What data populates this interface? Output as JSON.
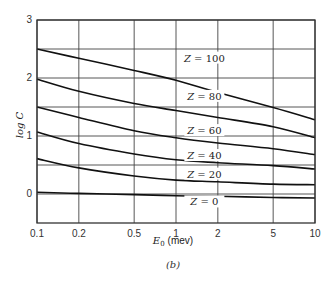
{
  "chart_data": {
    "type": "line",
    "title": "",
    "caption": "(b)",
    "xlabel": "E0 (mev)",
    "xlabel_main": "E",
    "xlabel_sub": "0",
    "xlabel_unit": "(mev)",
    "ylabel": "log C",
    "xscale": "log",
    "xlim": [
      0.1,
      10
    ],
    "ylim": [
      -0.5,
      3
    ],
    "grid": true,
    "legend_position": "inline labels",
    "x_ticks": [
      0.1,
      0.2,
      0.5,
      1,
      2,
      5,
      10
    ],
    "x_tick_labels": [
      "0.1",
      "0.2",
      "0.5",
      "1",
      "2",
      "5",
      "10"
    ],
    "y_ticks": [
      0,
      1,
      2,
      3
    ],
    "y_tick_labels": [
      "0",
      "1",
      "2",
      "3"
    ],
    "y_gridlines": [
      0,
      0.5,
      1,
      1.5,
      2,
      2.5,
      3
    ],
    "x": [
      0.1,
      0.2,
      0.5,
      1,
      2,
      5,
      10
    ],
    "series": [
      {
        "name": "Z = 100",
        "values": [
          2.5,
          2.34,
          2.13,
          1.96,
          1.75,
          1.49,
          1.28
        ]
      },
      {
        "name": "Z = 80",
        "values": [
          1.98,
          1.77,
          1.56,
          1.44,
          1.32,
          1.16,
          0.97
        ]
      },
      {
        "name": "Z = 60",
        "values": [
          1.5,
          1.32,
          1.09,
          0.97,
          0.88,
          0.78,
          0.68
        ]
      },
      {
        "name": "Z = 40",
        "values": [
          1.07,
          0.87,
          0.69,
          0.59,
          0.54,
          0.49,
          0.43
        ]
      },
      {
        "name": "Z = 20",
        "values": [
          0.61,
          0.45,
          0.31,
          0.24,
          0.21,
          0.17,
          0.16
        ]
      },
      {
        "name": "Z = 0",
        "values": [
          0.03,
          0.01,
          -0.01,
          -0.03,
          -0.04,
          -0.06,
          -0.07
        ]
      }
    ],
    "annotations": [
      {
        "text": "Z = 100",
        "x": 1.6,
        "y": 2.3
      },
      {
        "text": "Z = 80",
        "x": 1.6,
        "y": 1.64
      },
      {
        "text": "Z = 60",
        "x": 1.6,
        "y": 1.05
      },
      {
        "text": "Z = 40",
        "x": 1.6,
        "y": 0.62
      },
      {
        "text": "Z = 20",
        "x": 1.6,
        "y": 0.3
      },
      {
        "text": "Z = 0",
        "x": 1.6,
        "y": -0.18
      }
    ]
  }
}
